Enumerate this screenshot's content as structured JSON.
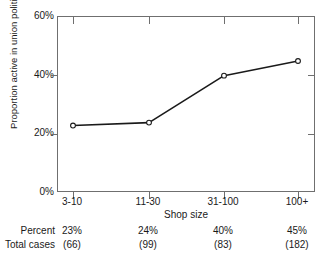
{
  "figure": {
    "top_caption_fragment": "",
    "background_color": "#ffffff",
    "axis_color": "#6f6f6f",
    "line_color": "#1a1a1a",
    "marker_fill": "#ffffff"
  },
  "chart_data": {
    "type": "line",
    "title": "",
    "xlabel": "Shop size",
    "ylabel": "Proportion active in union politics",
    "categories": [
      "3-10",
      "11-30",
      "31-100",
      "100+"
    ],
    "values": [
      23,
      24,
      40,
      45
    ],
    "ylim": [
      0,
      60
    ],
    "yticks": [
      0,
      20,
      40,
      60
    ],
    "ytick_labels": [
      "0%",
      "20%",
      "40%",
      "60%"
    ],
    "grid": false,
    "legend": null,
    "marker": "open-circle",
    "series": [
      {
        "name": "Proportion active in union politics",
        "values": [
          23,
          24,
          40,
          45
        ]
      }
    ]
  },
  "stats_table": {
    "rows": [
      {
        "label": "Percent",
        "values": [
          "23%",
          "24%",
          "40%",
          "45%"
        ]
      },
      {
        "label": "Total cases",
        "values": [
          "(66)",
          "(99)",
          "(83)",
          "(182)"
        ]
      }
    ]
  }
}
